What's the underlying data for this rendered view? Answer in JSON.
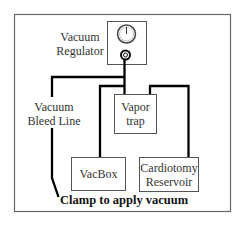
{
  "diagram": {
    "regulator_label_line1": "Vacuum",
    "regulator_label_line2": "Regulator",
    "bleed_label_line1": "Vacuum",
    "bleed_label_line2": "Bleed Line",
    "vapor_trap_line1": "Vapor",
    "vapor_trap_line2": "trap",
    "vacbox": "VacBox",
    "cardiotomy_line1": "Cardiotomy",
    "cardiotomy_line2": "Reservoir",
    "clamp_label": "Clamp to apply vacuum"
  }
}
